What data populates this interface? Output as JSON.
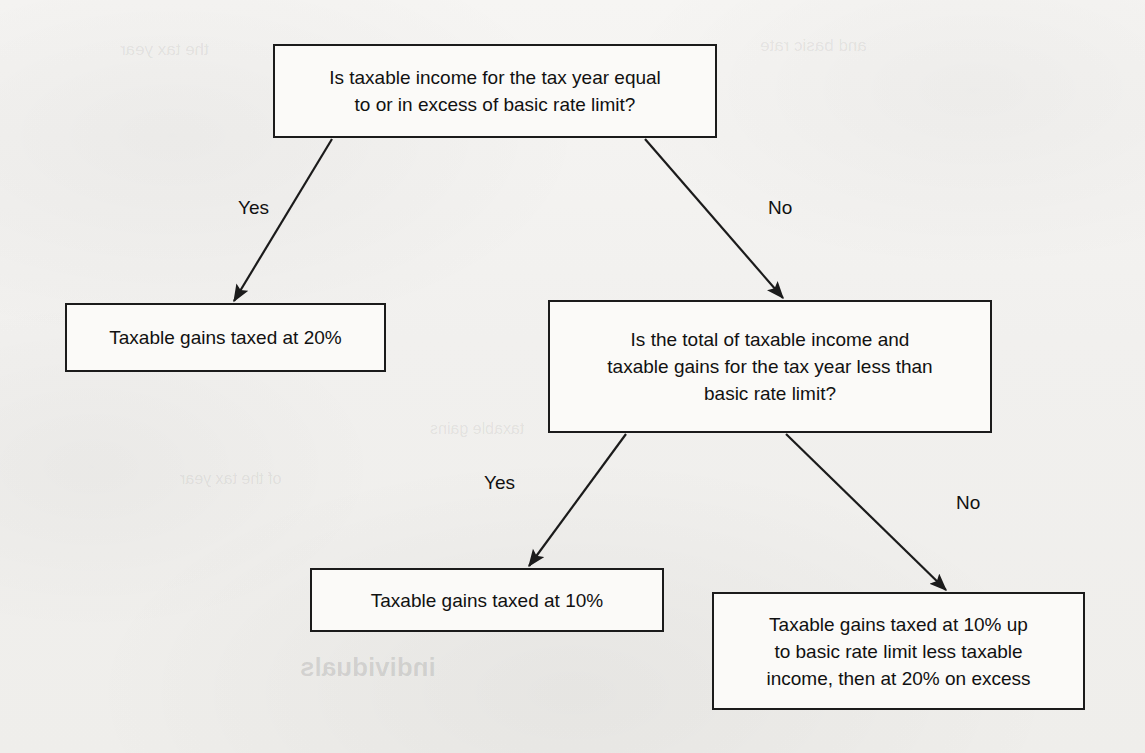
{
  "diagram": {
    "background_color": "#f1f0ee",
    "line_color": "#1b1b1b",
    "box_fill": "#fbfaf8",
    "text_color": "#111111"
  },
  "nodes": {
    "decision1": {
      "id": "decision1",
      "type": "decision",
      "line1": "Is taxable income for the tax year equal",
      "line2": "to or in excess of basic rate limit?",
      "box": {
        "x": 273,
        "y": 44,
        "w": 444,
        "h": 94
      }
    },
    "outcome_20": {
      "id": "outcome_20",
      "type": "outcome",
      "line1": "Taxable gains taxed at 20%",
      "box": {
        "x": 65,
        "y": 303,
        "w": 321,
        "h": 69
      }
    },
    "decision2": {
      "id": "decision2",
      "type": "decision",
      "line1": "Is the total of taxable income and",
      "line2": "taxable gains for the tax year less than",
      "line3": "basic rate limit?",
      "box": {
        "x": 548,
        "y": 300,
        "w": 444,
        "h": 133
      }
    },
    "outcome_10": {
      "id": "outcome_10",
      "type": "outcome",
      "line1": "Taxable gains taxed at 10%",
      "box": {
        "x": 310,
        "y": 568,
        "w": 354,
        "h": 64
      }
    },
    "outcome_mixed": {
      "id": "outcome_mixed",
      "type": "outcome",
      "line1": "Taxable gains taxed at 10% up",
      "line2": "to basic rate limit less taxable",
      "line3": "income, then at 20% on excess",
      "box": {
        "x": 712,
        "y": 592,
        "w": 373,
        "h": 118
      }
    }
  },
  "edges": [
    {
      "id": "edge-d1-yes",
      "from": "decision1",
      "to": "outcome_20",
      "label": "Yes",
      "label_pos": {
        "x": 238,
        "y": 198
      },
      "path": {
        "x1": 332,
        "y1": 139,
        "x2": 234,
        "y2": 301
      }
    },
    {
      "id": "edge-d1-no",
      "from": "decision1",
      "to": "decision2",
      "label": "No",
      "label_pos": {
        "x": 768,
        "y": 198
      },
      "path": {
        "x1": 645,
        "y1": 139,
        "x2": 783,
        "y2": 298
      }
    },
    {
      "id": "edge-d2-yes",
      "from": "decision2",
      "to": "outcome_10",
      "label": "Yes",
      "label_pos": {
        "x": 484,
        "y": 473
      },
      "path": {
        "x1": 626,
        "y1": 434,
        "x2": 529,
        "y2": 566
      }
    },
    {
      "id": "edge-d2-no",
      "from": "decision2",
      "to": "outcome_mixed",
      "label": "No",
      "label_pos": {
        "x": 956,
        "y": 493
      },
      "path": {
        "x1": 786,
        "y1": 434,
        "x2": 946,
        "y2": 590
      }
    }
  ],
  "ghost_text": [
    {
      "text": "the tax year",
      "x": 120,
      "y": 40,
      "size": 17,
      "light": true
    },
    {
      "text": "and basic rate",
      "x": 760,
      "y": 36,
      "size": 17,
      "light": true
    },
    {
      "text": "excess of the",
      "x": 160,
      "y": 330,
      "size": 16,
      "light": true
    },
    {
      "text": "taxable gains",
      "x": 430,
      "y": 420,
      "size": 16,
      "light": true
    },
    {
      "text": "of the tax year",
      "x": 180,
      "y": 470,
      "size": 16,
      "light": true
    },
    {
      "text": "individuals",
      "x": 300,
      "y": 652,
      "size": 26,
      "light": false
    },
    {
      "text": "the tax",
      "x": 760,
      "y": 648,
      "size": 24,
      "light": false
    }
  ]
}
